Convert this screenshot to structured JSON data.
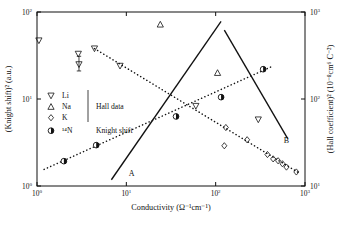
{
  "chart_data": {
    "type": "scatter",
    "title": "",
    "xlabel": "Conductivity (Ω⁻¹cm⁻¹)",
    "ylabel": "(Knight shift)² (a.u.)",
    "y2label": "(Hall coefficient)² (10⁻⁸cm⁶ C⁻²)",
    "xscale": "log",
    "yscale": "log",
    "xlim": [
      1,
      1000
    ],
    "ylim": [
      1,
      100
    ],
    "y2lim": [
      10,
      1000
    ],
    "grid": false,
    "xticks": [
      "10⁰",
      "10¹",
      "10²",
      "10³"
    ],
    "xtick_values": [
      1,
      10,
      100,
      1000
    ],
    "yticks": [
      "10⁰",
      "10¹",
      "10²"
    ],
    "ytick_values": [
      1,
      10,
      100
    ],
    "y2ticks": [
      "10¹",
      "10²",
      "10³"
    ],
    "y2tick_values": [
      10,
      100,
      1000
    ],
    "legend_position": "center-left",
    "legend_groups": [
      {
        "group_label": "Hall data",
        "entries": [
          {
            "label": "Li",
            "marker": "triangle-down-open"
          },
          {
            "label": "Na",
            "marker": "triangle-up-open"
          },
          {
            "label": "K",
            "marker": "diamond-open"
          }
        ]
      },
      {
        "group_label": "Knight shift",
        "entries": [
          {
            "label": "¹⁴N",
            "marker": "circle-half-filled"
          }
        ]
      }
    ],
    "annotations": [
      {
        "text": "A",
        "x": 11.5,
        "y": 1.32
      },
      {
        "text": "B",
        "x": 620,
        "y": 3.1
      }
    ],
    "series": [
      {
        "name": "Li",
        "marker": "triangle-down-open",
        "points": [
          {
            "x": 1.05,
            "y": 47
          },
          {
            "x": 2.9,
            "y": 33
          },
          {
            "x": 2.95,
            "y": 25
          },
          {
            "x": 4.4,
            "y": 38
          },
          {
            "x": 8.5,
            "y": 24
          },
          {
            "x": 60,
            "y": 8.3
          },
          {
            "x": 300,
            "y": 5.8
          }
        ],
        "errorbars": [
          {
            "x": 2.95,
            "y": 25,
            "ylow": 21,
            "yhigh": 31
          }
        ]
      },
      {
        "name": "Na",
        "marker": "triangle-up-open",
        "points": [
          {
            "x": 24,
            "y": 72
          },
          {
            "x": 105,
            "y": 20
          }
        ]
      },
      {
        "name": "K",
        "marker": "diamond-open",
        "points": [
          {
            "x": 130,
            "y": 4.7
          },
          {
            "x": 125,
            "y": 2.9
          },
          {
            "x": 225,
            "y": 3.4
          },
          {
            "x": 380,
            "y": 2.3
          },
          {
            "x": 440,
            "y": 2.05
          },
          {
            "x": 500,
            "y": 1.95
          },
          {
            "x": 560,
            "y": 1.8
          },
          {
            "x": 620,
            "y": 1.65
          },
          {
            "x": 800,
            "y": 1.45
          }
        ]
      },
      {
        "name": "¹⁴N",
        "marker": "circle-half-filled",
        "points": [
          {
            "x": 2.0,
            "y": 1.93
          },
          {
            "x": 4.6,
            "y": 2.95
          },
          {
            "x": 36,
            "y": 6.3
          },
          {
            "x": 115,
            "y": 10.5
          },
          {
            "x": 340,
            "y": 22
          }
        ]
      }
    ],
    "fit_lines": [
      {
        "name": "A",
        "style": "solid",
        "x1": 6.8,
        "y1": 1.18,
        "x2": 115,
        "y2": 78
      },
      {
        "name": "B",
        "style": "solid",
        "x1": 125,
        "y1": 62,
        "x2": 640,
        "y2": 3.5
      },
      {
        "name": "hall-trend",
        "style": "dotted",
        "x1": 4.4,
        "y1": 38,
        "x2": 870,
        "y2": 1.4
      },
      {
        "name": "knight-trend",
        "style": "dotted",
        "x1": 1.2,
        "y1": 1.55,
        "x2": 440,
        "y2": 24
      }
    ]
  }
}
